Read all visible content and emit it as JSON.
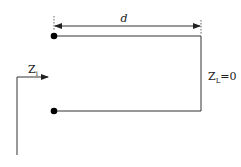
{
  "diagram": {
    "dimension_label": "d",
    "input_impedance": {
      "main": "Z",
      "sub": "i"
    },
    "load_impedance": {
      "main": "Z",
      "sub": "L",
      "value": "=0"
    },
    "colors": {
      "line": "#333333",
      "terminal": "#000000",
      "dimension": "#555555"
    }
  }
}
